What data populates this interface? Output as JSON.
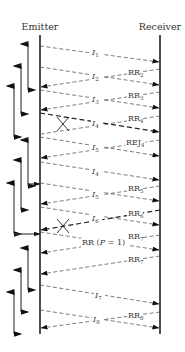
{
  "diagram": {
    "type": "sequence",
    "headers": {
      "emitter": "Emitter",
      "receiver": "Receiver"
    },
    "lifelines": {
      "emitter_x": 40,
      "receiver_x": 160,
      "top_y": 35,
      "bottom_y": 334
    },
    "messages": [
      {
        "id": "I1",
        "base": "I",
        "sub": "1",
        "italic": true,
        "dir": "right",
        "y1": 46,
        "y2": 62,
        "lost": false,
        "bold": false
      },
      {
        "id": "I2",
        "base": "I",
        "sub": "2",
        "italic": true,
        "dir": "right",
        "y1": 67,
        "y2": 85,
        "lost": false,
        "bold": false
      },
      {
        "id": "RR2",
        "base": "RR",
        "sub": "2",
        "italic": false,
        "dir": "left",
        "y1": 69,
        "y2": 87,
        "lost": false,
        "bold": false
      },
      {
        "id": "I3",
        "base": "I",
        "sub": "3",
        "italic": true,
        "dir": "right",
        "y1": 90,
        "y2": 108,
        "lost": false,
        "bold": false
      },
      {
        "id": "RR3",
        "base": "RR",
        "sub": "3",
        "italic": false,
        "dir": "left",
        "y1": 92,
        "y2": 110,
        "lost": false,
        "bold": false
      },
      {
        "id": "I4",
        "base": "I",
        "sub": "4",
        "italic": true,
        "dir": "right",
        "y1": 113,
        "y2": 132,
        "lost": false,
        "bold": true
      },
      {
        "id": "RR4",
        "base": "RR",
        "sub": "4",
        "italic": false,
        "dir": "left",
        "y1": 116,
        "y2": 134,
        "lost": true,
        "bold": false
      },
      {
        "id": "I5",
        "base": "I",
        "sub": "5",
        "italic": true,
        "dir": "right",
        "y1": 137,
        "y2": 156,
        "lost": false,
        "bold": false
      },
      {
        "id": "REJ4",
        "base": "REJ",
        "sub": "4",
        "italic": false,
        "dir": "left",
        "y1": 140,
        "y2": 158,
        "lost": false,
        "bold": false
      },
      {
        "id": "I4-resend",
        "base": "I",
        "sub": "4",
        "italic": true,
        "dir": "right",
        "y1": 162,
        "y2": 180,
        "lost": false,
        "bold": false
      },
      {
        "id": "I5-resend",
        "base": "I",
        "sub": "5",
        "italic": true,
        "dir": "right",
        "y1": 183,
        "y2": 201,
        "lost": false,
        "bold": false
      },
      {
        "id": "RR5",
        "base": "RR",
        "sub": "5",
        "italic": false,
        "dir": "left",
        "y1": 186,
        "y2": 204,
        "lost": false,
        "bold": false
      },
      {
        "id": "I6",
        "base": "I",
        "sub": "6",
        "italic": true,
        "dir": "right",
        "y1": 207,
        "y2": 225,
        "lost": false,
        "bold": false
      },
      {
        "id": "RR6",
        "base": "RR",
        "sub": "6",
        "italic": false,
        "dir": "left",
        "y1": 210,
        "y2": 230,
        "lost": true,
        "bold": true
      },
      {
        "id": "RR-P1",
        "base": "RR (",
        "sub": "",
        "italic": false,
        "dir": "right",
        "y1": 232,
        "y2": 250,
        "lost": false,
        "bold": false,
        "full_label": "RR (P = 1)"
      },
      {
        "id": "RR7",
        "base": "RR",
        "sub": "7",
        "italic": false,
        "dir": "left",
        "y1": 235,
        "y2": 253,
        "lost": false,
        "bold": false
      },
      {
        "id": "RR7-b",
        "base": "RR",
        "sub": "7",
        "italic": false,
        "dir": "left",
        "y1": 256,
        "y2": 274,
        "lost": false,
        "bold": false
      },
      {
        "id": "I7",
        "base": "I",
        "sub": "7",
        "italic": true,
        "dir": "right",
        "y1": 285,
        "y2": 304,
        "lost": false,
        "bold": false
      },
      {
        "id": "I8",
        "base": "I",
        "sub": "8",
        "italic": true,
        "dir": "right",
        "y1": 310,
        "y2": 328,
        "lost": false,
        "bold": false
      },
      {
        "id": "RR8",
        "base": "RR",
        "sub": "8",
        "italic": false,
        "dir": "left",
        "y1": 312,
        "y2": 328,
        "lost": false,
        "bold": false
      }
    ],
    "labels": [
      {
        "text": "I",
        "sub": "1",
        "italic": true,
        "x": 92,
        "y": 55
      },
      {
        "text": "I",
        "sub": "2",
        "italic": true,
        "x": 92,
        "y": 79
      },
      {
        "text": "RR",
        "sub": "2",
        "italic": false,
        "x": 128,
        "y": 75
      },
      {
        "text": "I",
        "sub": "3",
        "italic": true,
        "x": 92,
        "y": 102
      },
      {
        "text": "RR",
        "sub": "3",
        "italic": false,
        "x": 128,
        "y": 98
      },
      {
        "text": "I",
        "sub": "4",
        "italic": true,
        "x": 92,
        "y": 126
      },
      {
        "text": "RR",
        "sub": "4",
        "italic": false,
        "x": 128,
        "y": 121
      },
      {
        "text": "I",
        "sub": "5",
        "italic": true,
        "x": 92,
        "y": 150
      },
      {
        "text": "REJ",
        "sub": "4",
        "italic": false,
        "x": 126,
        "y": 145
      },
      {
        "text": "I",
        "sub": "4",
        "italic": true,
        "x": 92,
        "y": 174
      },
      {
        "text": "I",
        "sub": "5",
        "italic": true,
        "x": 92,
        "y": 197
      },
      {
        "text": "RR",
        "sub": "5",
        "italic": false,
        "x": 128,
        "y": 191
      },
      {
        "text": "I",
        "sub": "6",
        "italic": true,
        "x": 92,
        "y": 221
      },
      {
        "text": "RR",
        "sub": "6",
        "italic": false,
        "x": 128,
        "y": 216
      },
      {
        "text": "RR (P = 1)",
        "sub": "",
        "italic": false,
        "x": 82,
        "y": 245
      },
      {
        "text": "RR",
        "sub": "7",
        "italic": false,
        "x": 128,
        "y": 239
      },
      {
        "text": "RR",
        "sub": "7",
        "italic": false,
        "x": 128,
        "y": 262
      },
      {
        "text": "I",
        "sub": "7",
        "italic": true,
        "x": 95,
        "y": 298
      },
      {
        "text": "I",
        "sub": "8",
        "italic": true,
        "x": 93,
        "y": 322
      },
      {
        "text": "RR",
        "sub": "8",
        "italic": false,
        "x": 128,
        "y": 318
      }
    ],
    "lost_marks": [
      {
        "x": 63,
        "y": 124
      },
      {
        "x": 63,
        "y": 226
      }
    ],
    "timers": [
      {
        "x": 28,
        "y_top": 44,
        "y_bottom": 90
      },
      {
        "x": 21,
        "y_top": 66,
        "y_bottom": 114
      },
      {
        "x": 14,
        "y_top": 86,
        "y_bottom": 137
      },
      {
        "x": 28,
        "y_top": 140,
        "y_bottom": 186
      },
      {
        "x": 21,
        "y_top": 160,
        "y_bottom": 210
      },
      {
        "x": 14,
        "y_top": 183,
        "y_bottom": 234
      },
      {
        "x": 28,
        "y_top": 248,
        "y_bottom": 290
      },
      {
        "x": 21,
        "y_top": 270,
        "y_bottom": 312
      },
      {
        "x": 14,
        "y_top": 292,
        "y_bottom": 334
      }
    ],
    "timer_links": [
      {
        "from_x": 28,
        "y": 184,
        "to_x": 40
      },
      {
        "from_x": 14,
        "y": 234,
        "to_x": 40
      }
    ]
  }
}
